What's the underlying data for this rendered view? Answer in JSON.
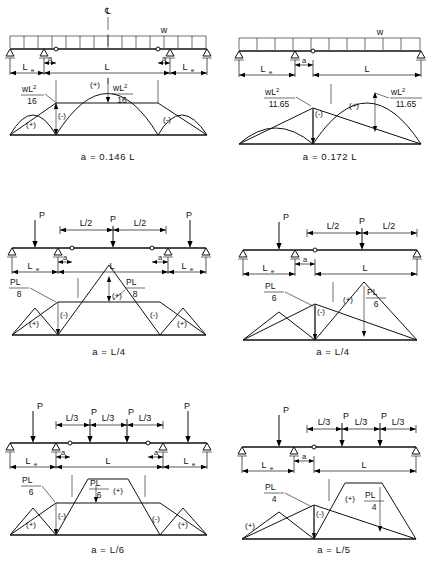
{
  "figure": {
    "panels": [
      {
        "id": "panel-1",
        "load_type": "uniform",
        "load_symbol": "w",
        "centerline_symbol": "℄",
        "spans": [
          "L e",
          "L",
          "L e"
        ],
        "dim_labels": {
          "left_span": "L",
          "left_span_sub": "e",
          "mid_span": "L",
          "right_span": "L",
          "right_span_sub": "e",
          "hinge_offset": "a"
        },
        "moment_left_label": {
          "numerator": "wL",
          "exponent": "2",
          "denominator": "16"
        },
        "moment_right_label": {
          "numerator": "wL",
          "exponent": "2",
          "denominator": "16"
        },
        "signs": [
          "(+)",
          "(-)",
          "(+)",
          "(-)"
        ],
        "caption": "a = 0.146 L"
      },
      {
        "id": "panel-2",
        "load_type": "uniform",
        "load_symbol": "w",
        "spans": [
          "L e",
          "L"
        ],
        "dim_labels": {
          "left_span": "L",
          "left_span_sub": "e",
          "mid_span": "L",
          "hinge_offset": "a"
        },
        "moment_left_label": {
          "numerator": "wL",
          "exponent": "2",
          "denominator": "11.65"
        },
        "moment_right_label": {
          "numerator": "wL",
          "exponent": "2",
          "denominator": "11.65"
        },
        "signs": [
          "(-)",
          "(+)"
        ],
        "caption": "a = 0.172 L"
      },
      {
        "id": "panel-3",
        "load_type": "point",
        "load_symbol": "P",
        "point_loads": [
          "P",
          "P",
          "P"
        ],
        "segment_labels": [
          "L/2",
          "L/2"
        ],
        "dim_labels": {
          "left_span": "L",
          "left_span_sub": "e",
          "mid_span": "L",
          "right_span": "L",
          "right_span_sub": "e",
          "hinge_offset": "a"
        },
        "moment_left_label": {
          "numerator": "PL",
          "exponent": "",
          "denominator": "8"
        },
        "moment_right_label": {
          "numerator": "PL",
          "exponent": "",
          "denominator": "8"
        },
        "signs": [
          "(+)",
          "(-)",
          "(+)",
          "(-)",
          "(+)"
        ],
        "caption": "a = L/4"
      },
      {
        "id": "panel-4",
        "load_type": "point",
        "load_symbol": "P",
        "point_loads": [
          "P",
          "P"
        ],
        "segment_labels": [
          "L/2",
          "L/2"
        ],
        "dim_labels": {
          "left_span": "L",
          "left_span_sub": "e",
          "mid_span": "L",
          "hinge_offset": "a"
        },
        "moment_left_label": {
          "numerator": "PL",
          "exponent": "",
          "denominator": "6"
        },
        "moment_right_label": {
          "numerator": "PL",
          "exponent": "",
          "denominator": "6"
        },
        "signs": [
          "(-)",
          "(+)"
        ],
        "caption": "a = L/4"
      },
      {
        "id": "panel-5",
        "load_type": "point",
        "load_symbol": "P",
        "point_loads": [
          "P",
          "P",
          "P",
          "P"
        ],
        "segment_labels": [
          "L/3",
          "L/3",
          "L/3"
        ],
        "dim_labels": {
          "left_span": "L",
          "left_span_sub": "e",
          "mid_span": "L",
          "right_span": "L",
          "right_span_sub": "e",
          "hinge_offset": "a"
        },
        "moment_left_label": {
          "numerator": "PL",
          "exponent": "",
          "denominator": "6"
        },
        "moment_right_label": {
          "numerator": "PL",
          "exponent": "",
          "denominator": "6"
        },
        "signs": [
          "(+)",
          "(-)",
          "(+)",
          "(-)",
          "(+)"
        ],
        "caption": "a = L/6"
      },
      {
        "id": "panel-6",
        "load_type": "point",
        "load_symbol": "P",
        "point_loads": [
          "P",
          "P",
          "P"
        ],
        "segment_labels": [
          "L/3",
          "L/3",
          "L/3"
        ],
        "dim_labels": {
          "left_span": "L",
          "left_span_sub": "e",
          "mid_span": "L",
          "hinge_offset": "a"
        },
        "moment_left_label": {
          "numerator": "PL",
          "exponent": "",
          "denominator": "4"
        },
        "moment_right_label": {
          "numerator": "PL",
          "exponent": "",
          "denominator": "4"
        },
        "signs": [
          "(+)",
          "(-)",
          "(+)"
        ],
        "caption": "a = L/5"
      }
    ]
  }
}
